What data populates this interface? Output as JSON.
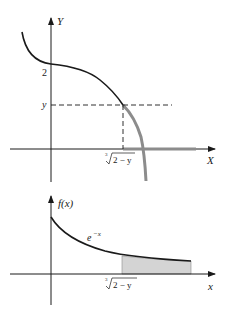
{
  "top_plot": {
    "y_axis_label": "Y",
    "x_axis_label": "X",
    "tick_2_label": "2",
    "tick_y_label": "y",
    "x_tick_label": "∛2 − y",
    "x_tick_radical_index": "3",
    "x_tick_radicand": "2 − y",
    "curve_color": "#1a1a1a",
    "highlight_color": "#8c8c8c"
  },
  "bottom_plot": {
    "y_axis_label": "f(x)",
    "x_axis_label": "x",
    "curve_label_base": "e",
    "curve_label_exponent": "−x",
    "x_tick_radical_index": "3",
    "x_tick_radicand": "2 − y",
    "shade_color": "#d4d4d4"
  }
}
